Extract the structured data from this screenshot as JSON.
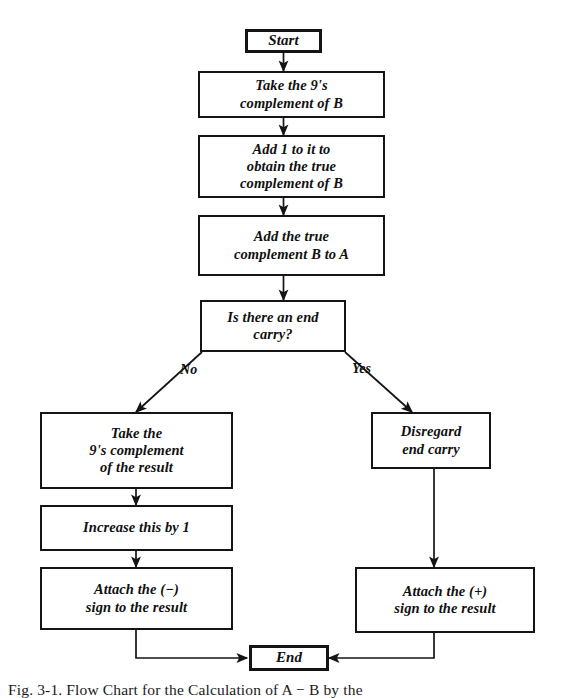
{
  "figure": {
    "caption": "Fig. 3-1.  Flow Chart for the Calculation of A − B by the",
    "ink_color": "#141414",
    "background": "#ffffff"
  },
  "nodes": {
    "start": {
      "label": "Start",
      "shape": "rectangle"
    },
    "nines_complement_b": {
      "label": "Take the 9's\ncomplement of B",
      "shape": "rectangle"
    },
    "add_one": {
      "label": "Add 1 to it to\nobtain the true\ncomplement of B",
      "shape": "rectangle"
    },
    "add_true_complement": {
      "label": "Add the true\ncomplement B to A",
      "shape": "rectangle"
    },
    "decision_end_carry": {
      "label": "Is there an end carry?",
      "shape": "rectangle"
    },
    "take_nines_result": {
      "label": "Take the\n9's complement\nof the result",
      "shape": "rectangle"
    },
    "increase_by_one": {
      "label": "Increase this by 1",
      "shape": "rectangle"
    },
    "attach_minus": {
      "label": "Attach the (−)\nsign to the result",
      "shape": "rectangle"
    },
    "disregard_end_carry": {
      "label": "Disregard\nend carry",
      "shape": "rectangle"
    },
    "attach_plus": {
      "label": "Attach the (+)\nsign to the result",
      "shape": "rectangle"
    },
    "end": {
      "label": "End",
      "shape": "rectangle"
    }
  },
  "branches": {
    "no_label": "No",
    "yes_label": "Yes"
  },
  "edges": [
    {
      "from": "start",
      "to": "nines_complement_b",
      "label": ""
    },
    {
      "from": "nines_complement_b",
      "to": "add_one",
      "label": ""
    },
    {
      "from": "add_one",
      "to": "add_true_complement",
      "label": ""
    },
    {
      "from": "add_true_complement",
      "to": "decision_end_carry",
      "label": ""
    },
    {
      "from": "decision_end_carry",
      "to": "take_nines_result",
      "label": "No"
    },
    {
      "from": "decision_end_carry",
      "to": "disregard_end_carry",
      "label": "Yes"
    },
    {
      "from": "take_nines_result",
      "to": "increase_by_one",
      "label": ""
    },
    {
      "from": "increase_by_one",
      "to": "attach_minus",
      "label": ""
    },
    {
      "from": "attach_minus",
      "to": "end",
      "label": ""
    },
    {
      "from": "disregard_end_carry",
      "to": "attach_plus",
      "label": ""
    },
    {
      "from": "attach_plus",
      "to": "end",
      "label": ""
    }
  ]
}
